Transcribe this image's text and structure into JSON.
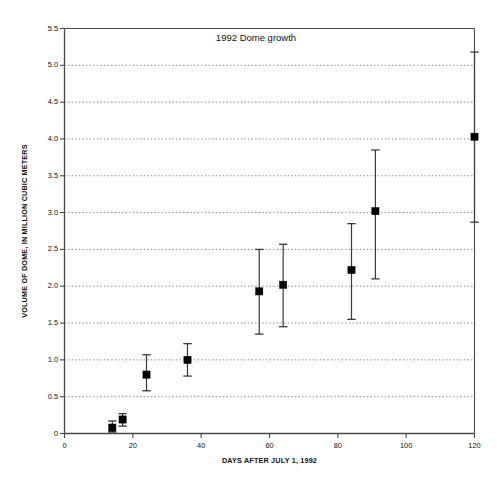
{
  "chart_data": {
    "type": "scatter",
    "title": "1992 Dome growth",
    "xlabel": "DAYS AFTER JULY 1, 1992",
    "ylabel": "VOLUME OF DOME, IN MILLION CUBIC METERS",
    "xlim": [
      0,
      120
    ],
    "ylim": [
      0,
      5.5
    ],
    "xticks": [
      0,
      20,
      40,
      60,
      80,
      100,
      120
    ],
    "xtick_labels": [
      "0",
      "20",
      "40",
      "60",
      "80",
      "100",
      "120"
    ],
    "yticks": [
      0,
      0.5,
      1.0,
      1.5,
      2.0,
      2.5,
      3.0,
      3.5,
      4.0,
      4.5,
      5.0,
      5.5
    ],
    "ytick_labels": [
      "0",
      "0.5",
      "1.0",
      "1.5",
      "2.0",
      "2.5",
      "3.0",
      "3.5",
      "4.0",
      "4.5",
      "5.0",
      "5.5"
    ],
    "grid": true,
    "grid_axis": "y",
    "grid_style": "dotted",
    "legend": null,
    "marker": "filled-square",
    "marker_color": "#000000",
    "errorbar_color": "#3a3a3a",
    "x": [
      14,
      17,
      24,
      36,
      57,
      64,
      84,
      91,
      120
    ],
    "y": [
      0.08,
      0.19,
      0.8,
      1.0,
      1.93,
      2.02,
      2.22,
      3.02,
      4.03
    ],
    "y_err_low": [
      0.02,
      0.1,
      0.58,
      0.78,
      1.35,
      1.45,
      1.55,
      2.1,
      2.87
    ],
    "y_err_high": [
      0.17,
      0.27,
      1.07,
      1.22,
      2.5,
      2.57,
      2.85,
      3.85,
      5.18
    ],
    "series_name": "Dome volume"
  },
  "axes": {
    "y_axis_title": "VOLUME OF DOME, IN MILLION CUBIC METERS",
    "x_axis_title": "DAYS AFTER JULY 1, 1992"
  },
  "title": "1992 Dome growth"
}
